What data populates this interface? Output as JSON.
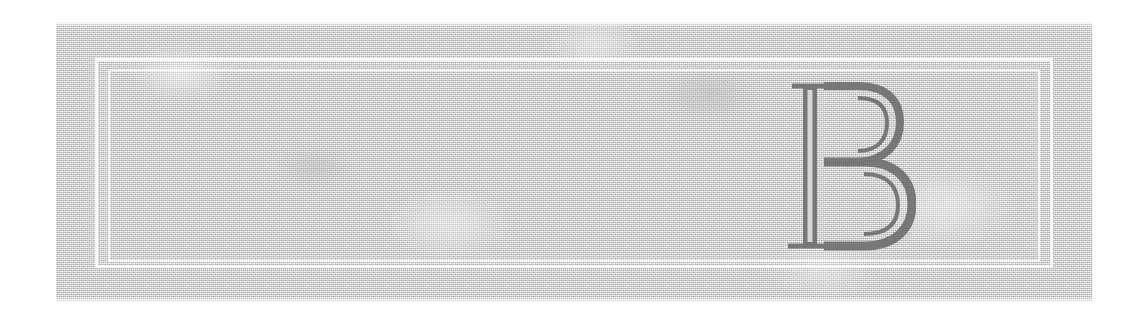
{
  "page": {
    "background_color": "#ffffff",
    "width": 1148,
    "height": 321
  },
  "panel": {
    "name": "textured-paper-panel",
    "base_color": "#d6d6d6",
    "texture": "fine-grey-noise-grain",
    "bounds": {
      "x": 56,
      "y": 22,
      "width": 1036,
      "height": 280
    }
  },
  "frame": {
    "style": "double-rule",
    "color": "#ffffff",
    "outer": {
      "x": 95,
      "y": 58,
      "width": 958,
      "height": 210
    },
    "inner": {
      "x": 108,
      "y": 69,
      "width": 932,
      "height": 193
    }
  },
  "dropcap": {
    "letter": "B",
    "style": "inline-engraved-didone-serif",
    "stroke_color": "#6b6b6b",
    "inline_color": "#d6d6d6",
    "bounds": {
      "x": 790,
      "y": 82,
      "width": 118,
      "height": 168
    }
  }
}
